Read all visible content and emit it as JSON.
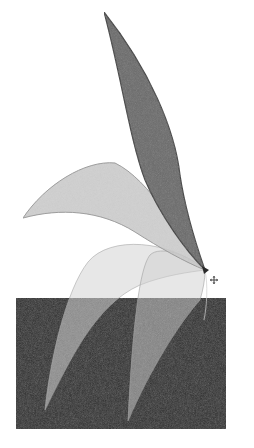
{
  "illustration": {
    "description": "Rotated petal shape copies around a pivot point over a dark rectangle",
    "canvas": {
      "width": 254,
      "height": 448,
      "background": "#ffffff"
    },
    "rectangle": {
      "x": 16,
      "y": 298,
      "width": 210,
      "height": 131,
      "fill": "#2e2e2e"
    },
    "pivot": {
      "x": 205,
      "y": 270
    },
    "colors": {
      "dark_petal_fill": "#6a6a6a",
      "dark_petal_stroke": "#3a3a3a",
      "light_petal_fill": "#c8c8c8",
      "light_petal_stroke": "#9a9a9a",
      "overlay_petal_fill": "#bdbdbd"
    },
    "petals": [
      {
        "name": "petal-top-dark",
        "tip": {
          "x": 104,
          "y": 12
        }
      },
      {
        "name": "petal-left-light",
        "tip": {
          "x": 23,
          "y": 218
        }
      },
      {
        "name": "petal-lower-left",
        "tip": {
          "x": 45,
          "y": 410
        }
      },
      {
        "name": "petal-lower-right",
        "tip": {
          "x": 128,
          "y": 421
        }
      }
    ],
    "cursor": {
      "icon": "move-cursor-icon",
      "x": 214,
      "y": 280
    }
  }
}
